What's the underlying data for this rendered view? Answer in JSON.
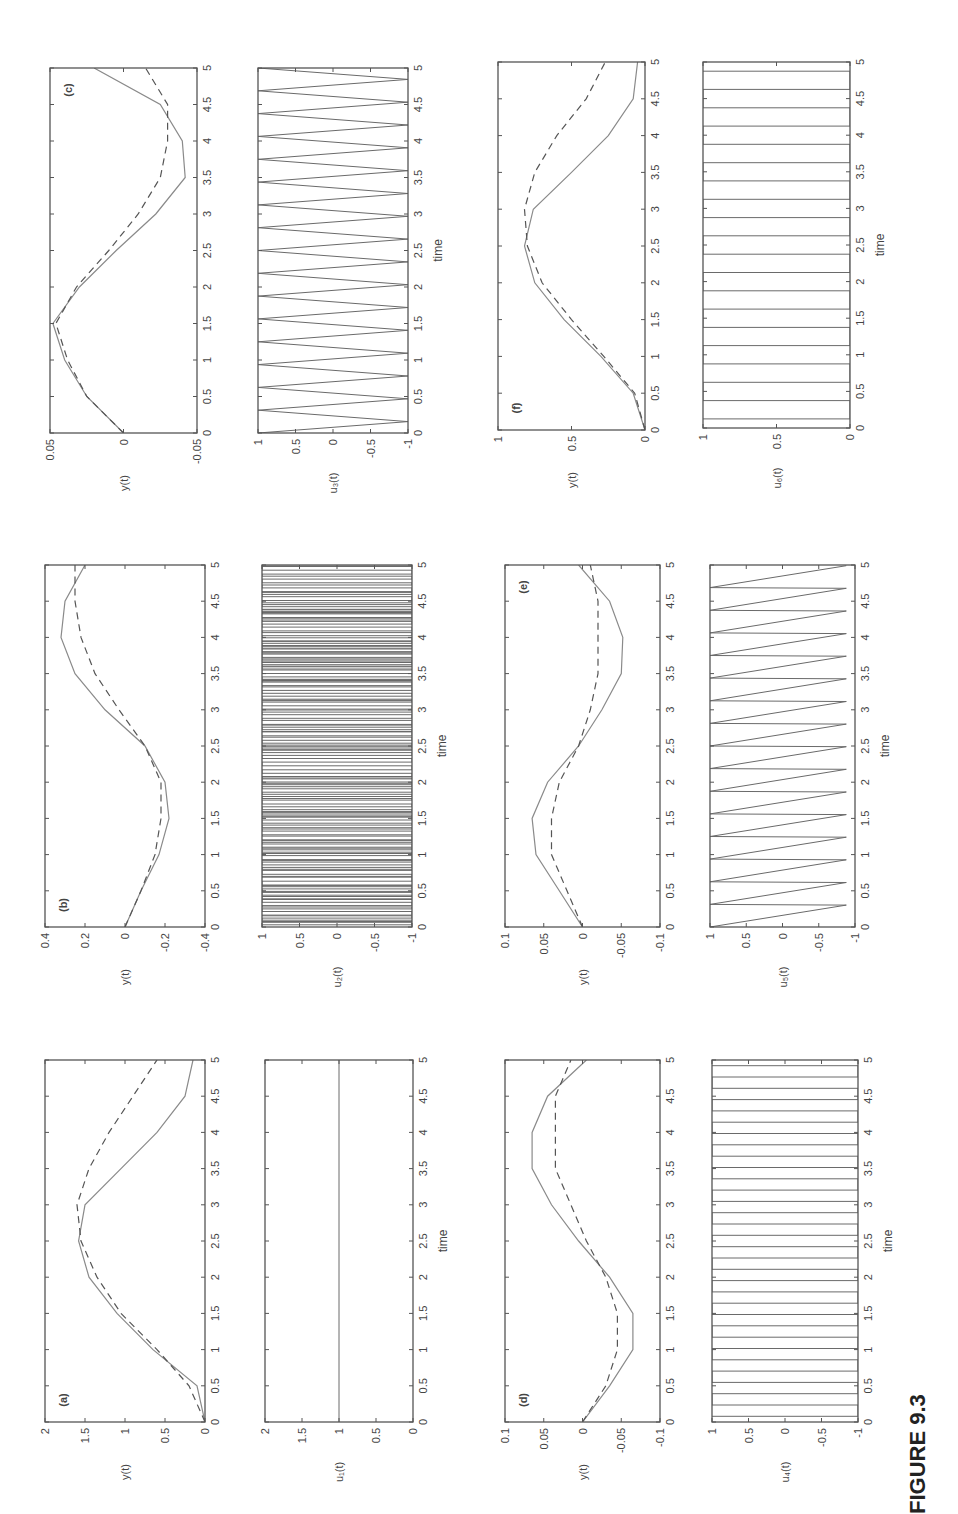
{
  "figure": {
    "caption": "FIGURE 9.3",
    "orientation": "rotated -90deg (time axis runs bottom-to-top)",
    "x_axis_label": "time"
  },
  "chart_data": [
    {
      "id": "a",
      "type": "line",
      "panel_label": "(a)",
      "ylabel": "y(t)",
      "xlabel": "",
      "xlim": [
        0,
        5
      ],
      "ylim": [
        0,
        2
      ],
      "xticks": [
        "0",
        "0.5",
        "1",
        "1.5",
        "2",
        "2.5",
        "3",
        "3.5",
        "4",
        "4.5",
        "5"
      ],
      "yticks": [
        "0",
        "0.5",
        "1",
        "1.5",
        "2"
      ],
      "x": [
        0,
        0.5,
        1,
        1.5,
        2,
        2.5,
        3,
        3.5,
        4,
        4.5,
        5
      ],
      "series": [
        {
          "name": "solid",
          "style": "solid",
          "values": [
            0,
            0.1,
            0.65,
            1.1,
            1.45,
            1.58,
            1.5,
            1.05,
            0.6,
            0.25,
            0.15
          ]
        },
        {
          "name": "dashed",
          "style": "dashed",
          "values": [
            0,
            0.2,
            0.6,
            1.05,
            1.35,
            1.55,
            1.6,
            1.45,
            1.2,
            0.9,
            0.6
          ]
        }
      ],
      "frame": {
        "left": 45,
        "right": 205,
        "top": 1060,
        "bottom": 1422
      }
    },
    {
      "id": "u1",
      "type": "line",
      "ylabel": "u₁(t)",
      "xlabel": "time",
      "xlim": [
        0,
        5
      ],
      "ylim": [
        0,
        2
      ],
      "xticks": [
        "0",
        "0.5",
        "1",
        "1.5",
        "2",
        "2.5",
        "3",
        "3.5",
        "4",
        "4.5",
        "5"
      ],
      "yticks": [
        "0",
        "0.5",
        "1",
        "1.5",
        "2"
      ],
      "signal": "constant",
      "value": 1,
      "frame": {
        "left": 265,
        "right": 413,
        "top": 1060,
        "bottom": 1422
      }
    },
    {
      "id": "b",
      "type": "line",
      "panel_label": "(b)",
      "ylabel": "y(t)",
      "xlabel": "",
      "xlim": [
        0,
        5
      ],
      "ylim": [
        -0.4,
        0.4
      ],
      "xticks": [
        "0",
        "0.5",
        "1",
        "1.5",
        "2",
        "2.5",
        "3",
        "3.5",
        "4",
        "4.5",
        "5"
      ],
      "yticks": [
        "-0.4",
        "-0.2",
        "0",
        "0.2",
        "0.4"
      ],
      "x": [
        0,
        0.5,
        1,
        1.5,
        2,
        2.5,
        3,
        3.5,
        4,
        4.5,
        5
      ],
      "series": [
        {
          "name": "solid",
          "style": "solid",
          "values": [
            0,
            -0.08,
            -0.17,
            -0.22,
            -0.2,
            -0.1,
            0.1,
            0.25,
            0.32,
            0.3,
            0.2
          ]
        },
        {
          "name": "dashed",
          "style": "dashed",
          "values": [
            0,
            -0.08,
            -0.15,
            -0.18,
            -0.18,
            -0.1,
            0.03,
            0.15,
            0.22,
            0.25,
            0.25
          ]
        }
      ],
      "frame": {
        "left": 45,
        "right": 205,
        "top": 565,
        "bottom": 927
      }
    },
    {
      "id": "u2",
      "type": "line",
      "ylabel": "u₂(t)",
      "xlabel": "time",
      "xlim": [
        0,
        5
      ],
      "ylim": [
        -1,
        1
      ],
      "xticks": [
        "0",
        "0.5",
        "1",
        "1.5",
        "2",
        "2.5",
        "3",
        "3.5",
        "4",
        "4.5",
        "5"
      ],
      "yticks": [
        "-1",
        "-0.5",
        "0",
        "0.5",
        "1"
      ],
      "signal": "random bang-bang switching between -1 and 1 (dense)",
      "frame": {
        "left": 262,
        "right": 412,
        "top": 565,
        "bottom": 927
      }
    },
    {
      "id": "c",
      "type": "line",
      "panel_label": "(c)",
      "ylabel": "y(t)",
      "xlabel": "",
      "xlim": [
        0,
        5
      ],
      "ylim": [
        -0.05,
        0.05
      ],
      "xticks": [
        "0",
        "0.5",
        "1",
        "1.5",
        "2",
        "2.5",
        "3",
        "3.5",
        "4",
        "4.5",
        "5"
      ],
      "yticks": [
        "-0.05",
        "0",
        "0.05"
      ],
      "x": [
        0,
        0.5,
        1,
        1.5,
        2,
        2.5,
        3,
        3.5,
        4,
        4.5,
        5
      ],
      "series": [
        {
          "name": "solid",
          "style": "solid",
          "values": [
            0,
            0.025,
            0.04,
            0.048,
            0.03,
            0.005,
            -0.022,
            -0.042,
            -0.04,
            -0.025,
            0.02
          ]
        },
        {
          "name": "dashed",
          "style": "dashed",
          "values": [
            0,
            0.025,
            0.038,
            0.046,
            0.032,
            0.01,
            -0.01,
            -0.025,
            -0.03,
            -0.03,
            -0.015
          ]
        }
      ],
      "frame": {
        "left": 50,
        "right": 197,
        "top": 68,
        "bottom": 433
      }
    },
    {
      "id": "u3",
      "type": "line",
      "ylabel": "u₃(t)",
      "xlabel": "time",
      "xlim": [
        0,
        5
      ],
      "ylim": [
        -1,
        1
      ],
      "xticks": [
        "0",
        "0.5",
        "1",
        "1.5",
        "2",
        "2.5",
        "3",
        "3.5",
        "4",
        "4.5",
        "5"
      ],
      "yticks": [
        "-1",
        "-0.5",
        "0",
        "0.5",
        "1"
      ],
      "signal": "triangular oscillation between -1 and 1",
      "cycles": 16,
      "frame": {
        "left": 258,
        "right": 408,
        "top": 68,
        "bottom": 433
      }
    },
    {
      "id": "d",
      "type": "line",
      "panel_label": "(d)",
      "ylabel": "y(t)",
      "xlabel": "",
      "xlim": [
        0,
        5
      ],
      "ylim": [
        -0.1,
        0.1
      ],
      "xticks": [
        "0",
        "0.5",
        "1",
        "1.5",
        "2",
        "2.5",
        "3",
        "3.5",
        "4",
        "4.5",
        "5"
      ],
      "yticks": [
        "-0.1",
        "-0.05",
        "0",
        "0.05",
        "0.1"
      ],
      "x": [
        0,
        0.5,
        1,
        1.5,
        2,
        2.5,
        3,
        3.5,
        4,
        4.5,
        5
      ],
      "series": [
        {
          "name": "solid",
          "style": "solid",
          "values": [
            0,
            -0.035,
            -0.065,
            -0.065,
            -0.035,
            0.005,
            0.04,
            0.065,
            0.065,
            0.045,
            -0.005
          ]
        },
        {
          "name": "dashed",
          "style": "dashed",
          "values": [
            0,
            -0.03,
            -0.045,
            -0.045,
            -0.03,
            -0.005,
            0.015,
            0.035,
            0.035,
            0.035,
            0.015
          ]
        }
      ],
      "frame": {
        "left": 505,
        "right": 660,
        "top": 1060,
        "bottom": 1422
      }
    },
    {
      "id": "u4",
      "type": "line",
      "ylabel": "u₄(t)",
      "xlabel": "time",
      "xlim": [
        0,
        5
      ],
      "ylim": [
        -1,
        1
      ],
      "xticks": [
        "0",
        "0.5",
        "1",
        "1.5",
        "2",
        "2.5",
        "3",
        "3.5",
        "4",
        "4.5",
        "5"
      ],
      "yticks": [
        "-1",
        "-0.5",
        "0",
        "0.5",
        "1"
      ],
      "signal": "fast square-wave switching between -1 and 1",
      "switches": 32,
      "frame": {
        "left": 712,
        "right": 858,
        "top": 1060,
        "bottom": 1422
      }
    },
    {
      "id": "e",
      "type": "line",
      "panel_label": "(e)",
      "ylabel": "y(t)",
      "xlabel": "",
      "xlim": [
        0,
        5
      ],
      "ylim": [
        -0.1,
        0.1
      ],
      "xticks": [
        "0",
        "0.5",
        "1",
        "1.5",
        "2",
        "2.5",
        "3",
        "3.5",
        "4",
        "4.5",
        "5"
      ],
      "yticks": [
        "-0.1",
        "-0.05",
        "0",
        "0.05",
        "0.1"
      ],
      "x": [
        0,
        0.5,
        1,
        1.5,
        2,
        2.5,
        3,
        3.5,
        4,
        4.5,
        5
      ],
      "series": [
        {
          "name": "solid",
          "style": "solid",
          "values": [
            0,
            0.03,
            0.06,
            0.065,
            0.045,
            0.005,
            -0.025,
            -0.05,
            -0.052,
            -0.035,
            0.005
          ]
        },
        {
          "name": "dashed",
          "style": "dashed",
          "values": [
            0,
            0.02,
            0.04,
            0.04,
            0.03,
            0.005,
            -0.01,
            -0.02,
            -0.02,
            -0.02,
            -0.01
          ]
        }
      ],
      "frame": {
        "left": 505,
        "right": 660,
        "top": 565,
        "bottom": 927
      }
    },
    {
      "id": "u5",
      "type": "line",
      "ylabel": "u₅(t)",
      "xlabel": "time",
      "xlim": [
        0,
        5
      ],
      "ylim": [
        -1,
        1
      ],
      "xticks": [
        "0",
        "0.5",
        "1",
        "1.5",
        "2",
        "2.5",
        "3",
        "3.5",
        "4",
        "4.5",
        "5"
      ],
      "yticks": [
        "-1",
        "-0.5",
        "0",
        "0.5",
        "1"
      ],
      "signal": "sawtooth between about -0.9 and 1",
      "teeth": 16,
      "frame": {
        "left": 710,
        "right": 855,
        "top": 565,
        "bottom": 927
      }
    },
    {
      "id": "f",
      "type": "line",
      "panel_label": "(f)",
      "ylabel": "y(t)",
      "xlabel": "",
      "xlim": [
        0,
        5
      ],
      "ylim": [
        0,
        1
      ],
      "xticks": [
        "0",
        "0.5",
        "1",
        "1.5",
        "2",
        "2.5",
        "3",
        "3.5",
        "4",
        "4.5",
        "5"
      ],
      "yticks": [
        "0",
        "0.5",
        "1"
      ],
      "x": [
        0,
        0.5,
        1,
        1.5,
        2,
        2.5,
        3,
        3.5,
        4,
        4.5,
        5
      ],
      "series": [
        {
          "name": "solid",
          "style": "solid",
          "values": [
            0,
            0.08,
            0.3,
            0.55,
            0.75,
            0.82,
            0.76,
            0.5,
            0.25,
            0.08,
            0.05
          ]
        },
        {
          "name": "dashed",
          "style": "dashed",
          "values": [
            0,
            0.07,
            0.28,
            0.5,
            0.7,
            0.8,
            0.82,
            0.75,
            0.6,
            0.4,
            0.27
          ]
        }
      ],
      "frame": {
        "left": 498,
        "right": 645,
        "top": 62,
        "bottom": 430
      }
    },
    {
      "id": "u6",
      "type": "line",
      "ylabel": "u₆(t)",
      "xlabel": "time",
      "xlim": [
        0,
        5
      ],
      "ylim": [
        0,
        1
      ],
      "xticks": [
        "0",
        "0.5",
        "1",
        "1.5",
        "2",
        "2.5",
        "3",
        "3.5",
        "4",
        "4.5",
        "5"
      ],
      "yticks": [
        "0",
        "0.5",
        "1"
      ],
      "signal": "fast switching between 0 and 1",
      "switches": 20,
      "frame": {
        "left": 703,
        "right": 850,
        "top": 62,
        "bottom": 428
      }
    }
  ]
}
